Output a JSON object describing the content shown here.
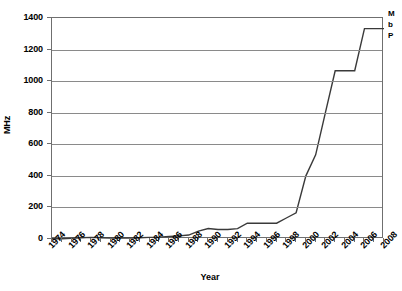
{
  "chart_data": {
    "type": "line",
    "title": "",
    "xlabel": "Year",
    "ylabel": "MHz",
    "xlim": [
      1974,
      2008
    ],
    "ylim": [
      0,
      1400
    ],
    "grid": true,
    "legend_position": "right",
    "y_ticks": [
      0,
      200,
      400,
      600,
      800,
      1000,
      1200,
      1400
    ],
    "x_tick_labels": [
      "1974",
      "1976",
      "1978",
      "1980",
      "1982",
      "1984",
      "1986",
      "1988",
      "1990",
      "1992",
      "1994",
      "1996",
      "1998",
      "2000",
      "2002",
      "2004",
      "2006",
      "2008"
    ],
    "x": [
      1974,
      1975,
      1976,
      1977,
      1978,
      1979,
      1980,
      1981,
      1982,
      1983,
      1984,
      1985,
      1986,
      1987,
      1988,
      1989,
      1990,
      1991,
      1992,
      1993,
      1994,
      1995,
      1996,
      1997,
      1998,
      1999,
      2000,
      2001,
      2002,
      2003,
      2004,
      2005,
      2006,
      2007,
      2008
    ],
    "series": [
      {
        "name": "MHz",
        "values": [
          2,
          2,
          5,
          8,
          10,
          8,
          6,
          6,
          6,
          8,
          10,
          12,
          16,
          20,
          25,
          50,
          66,
          60,
          60,
          66,
          100,
          100,
          100,
          100,
          133,
          166,
          400,
          533,
          800,
          1066,
          1066,
          1066,
          1333,
          1333,
          1333
        ]
      }
    ],
    "annotations": []
  },
  "legend": {
    "rows": [
      "M",
      "b",
      "P"
    ]
  }
}
